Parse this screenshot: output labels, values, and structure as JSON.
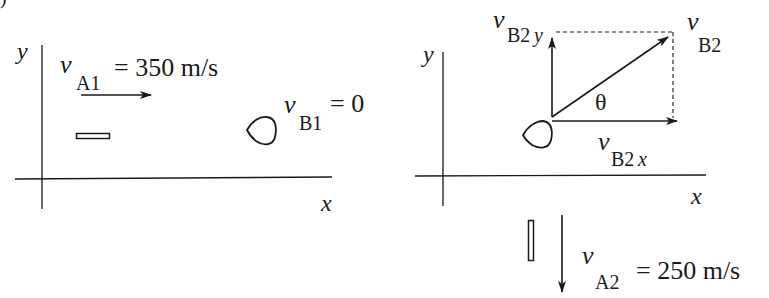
{
  "figure": {
    "partial_label": ")",
    "panel_before": {
      "axes": {
        "x_label": "x",
        "y_label": "y"
      },
      "bullet_A": {
        "velocity_symbol": "v",
        "velocity_subscript": "A1",
        "velocity_value": "= 350 m/s",
        "direction": "+x"
      },
      "puck_B": {
        "velocity_symbol": "v",
        "velocity_subscript": "B1",
        "velocity_value": "= 0"
      }
    },
    "panel_after": {
      "axes": {
        "x_label": "x",
        "y_label": "y"
      },
      "puck_B": {
        "resultant": {
          "symbol": "v",
          "subscript": "B2"
        },
        "x_component": {
          "symbol": "v",
          "subscript": "B2",
          "axis": "x"
        },
        "y_component": {
          "symbol": "v",
          "subscript": "B2",
          "axis": "y"
        },
        "angle_label": "θ"
      },
      "bullet_A": {
        "velocity_symbol": "v",
        "velocity_subscript": "A2",
        "velocity_value": "= 250 m/s",
        "direction": "-y"
      }
    },
    "colors": {
      "ink": "#1a1a1a",
      "background": "#ffffff"
    }
  }
}
